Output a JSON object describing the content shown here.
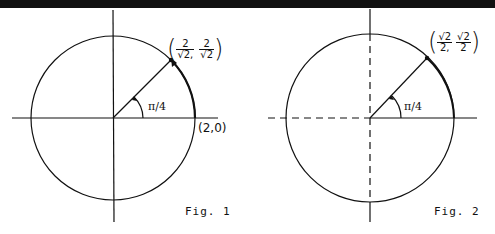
{
  "figures": [
    {
      "caption": "Fig. 1",
      "angle_label": "π/4",
      "point_label": {
        "x_num": "2",
        "x_den": "√2,",
        "y_num": "2",
        "y_den": "√2"
      },
      "axis_point_label": "(2,0)",
      "axes_style": "solid"
    },
    {
      "caption": "Fig. 2",
      "angle_label": "π/4",
      "point_label": {
        "x_num": "√2",
        "x_den": "2,",
        "y_num": "√2",
        "y_den": "2"
      },
      "axes_style": "dashed-negative"
    }
  ],
  "paren_open": "(",
  "paren_close": ")"
}
